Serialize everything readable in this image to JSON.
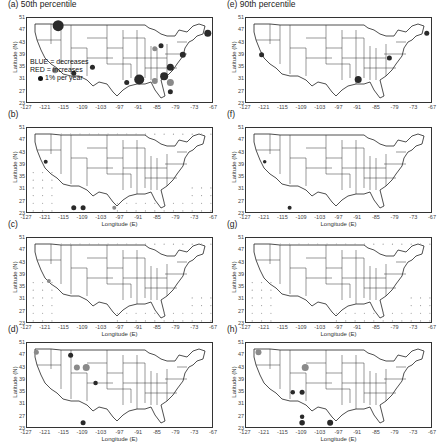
{
  "figure": {
    "panels": [
      {
        "id": "a",
        "title": "(a) 50th percentile",
        "left": 0,
        "top": 0,
        "show_xlabel": false,
        "show_legend": true
      },
      {
        "id": "b",
        "title": "(b)",
        "left": 0,
        "top": 110,
        "show_xlabel": true,
        "show_legend": false
      },
      {
        "id": "c",
        "title": "(c)",
        "left": 0,
        "top": 220,
        "show_xlabel": true,
        "show_legend": false
      },
      {
        "id": "d",
        "title": "(d)",
        "left": 0,
        "top": 325,
        "show_xlabel": true,
        "show_legend": false
      },
      {
        "id": "e",
        "title": "(e) 90th percentile",
        "left": 219,
        "top": 0,
        "show_xlabel": false,
        "show_legend": false
      },
      {
        "id": "f",
        "title": "(f)",
        "left": 219,
        "top": 110,
        "show_xlabel": true,
        "show_legend": false
      },
      {
        "id": "g",
        "title": "(g)",
        "left": 219,
        "top": 220,
        "show_xlabel": true,
        "show_legend": false
      },
      {
        "id": "h",
        "title": "(h)",
        "left": 219,
        "top": 325,
        "show_xlabel": true,
        "show_legend": false
      }
    ],
    "x_axis": {
      "label": "Longitude (E)",
      "ticks": [
        "-127",
        "-121",
        "-115",
        "-109",
        "-103",
        "-97",
        "-91",
        "-85",
        "-79",
        "-73",
        "-67"
      ],
      "range": [
        -127,
        -67
      ]
    },
    "y_axis": {
      "label": "Latitude (N)",
      "ticks": [
        "51",
        "47",
        "43",
        "39",
        "35",
        "31",
        "27",
        "23"
      ],
      "range": [
        23,
        51
      ]
    },
    "legend": {
      "line1": "BLUE = decreases",
      "line2": "RED = increases",
      "line3": "1% per year"
    },
    "colors": {
      "decrease": "#2a2a2a",
      "increase": "#8a8a8a",
      "outline": "#222222"
    }
  },
  "chart_data": [
    {
      "type": "scatter",
      "panel": "a",
      "title": "(a) 50th percentile",
      "xlabel": "Longitude (E)",
      "ylabel": "Latitude (N)",
      "xlim": [
        -127,
        -67
      ],
      "ylim": [
        23,
        51
      ],
      "points": [
        {
          "lon": -117,
          "lat": 48.5,
          "size": 10,
          "sign": "decrease"
        },
        {
          "lon": -69,
          "lat": 46,
          "size": 6,
          "sign": "decrease"
        },
        {
          "lon": -91,
          "lat": 31,
          "size": 9,
          "sign": "decrease"
        },
        {
          "lon": -83,
          "lat": 32,
          "size": 7,
          "sign": "decrease"
        },
        {
          "lon": -81,
          "lat": 30,
          "size": 6,
          "sign": "increase"
        },
        {
          "lon": -86,
          "lat": 30.5,
          "size": 5,
          "sign": "increase"
        },
        {
          "lon": -118,
          "lat": 34,
          "size": 5,
          "sign": "increase"
        },
        {
          "lon": -81,
          "lat": 35,
          "size": 6,
          "sign": "decrease"
        },
        {
          "lon": -77,
          "lat": 39,
          "size": 5,
          "sign": "decrease"
        },
        {
          "lon": -84,
          "lat": 42,
          "size": 4,
          "sign": "decrease"
        },
        {
          "lon": -95,
          "lat": 30,
          "size": 4,
          "sign": "decrease"
        },
        {
          "lon": -106,
          "lat": 35,
          "size": 4,
          "sign": "decrease"
        },
        {
          "lon": -112,
          "lat": 33,
          "size": 4,
          "sign": "decrease"
        },
        {
          "lon": -86,
          "lat": 41,
          "size": 4,
          "sign": "increase"
        },
        {
          "lon": -81,
          "lat": 27,
          "size": 4,
          "sign": "decrease"
        }
      ]
    },
    {
      "type": "scatter",
      "panel": "b",
      "title": "(b)",
      "grid_points": "sparse small dots; larger near SW (-110,25)",
      "points": [
        {
          "lon": -112,
          "lat": 25,
          "size": 4,
          "sign": "decrease"
        },
        {
          "lon": -109,
          "lat": 25,
          "size": 4,
          "sign": "decrease"
        },
        {
          "lon": -121,
          "lat": 40,
          "size": 3,
          "sign": "decrease"
        },
        {
          "lon": -99,
          "lat": 25,
          "size": 3,
          "sign": "increase"
        }
      ]
    },
    {
      "type": "scatter",
      "panel": "c",
      "title": "(c)",
      "grid_points": "small dots mostly SW offshore grid",
      "points": [
        {
          "lon": -120,
          "lat": 37,
          "size": 3,
          "sign": "increase"
        }
      ]
    },
    {
      "type": "scatter",
      "panel": "d",
      "title": "(d)",
      "points": [
        {
          "lon": -108,
          "lat": 43,
          "size": 6,
          "sign": "increase"
        },
        {
          "lon": -111,
          "lat": 43,
          "size": 5,
          "sign": "increase"
        },
        {
          "lon": -124,
          "lat": 48,
          "size": 4,
          "sign": "increase"
        },
        {
          "lon": -113,
          "lat": 47,
          "size": 4,
          "sign": "decrease"
        },
        {
          "lon": -105,
          "lat": 38,
          "size": 3.5,
          "sign": "decrease"
        },
        {
          "lon": -109,
          "lat": 25,
          "size": 4,
          "sign": "decrease"
        }
      ]
    },
    {
      "type": "scatter",
      "panel": "e",
      "title": "(e) 90th percentile",
      "points": [
        {
          "lon": -91,
          "lat": 31,
          "size": 6,
          "sign": "decrease"
        },
        {
          "lon": -122,
          "lat": 39,
          "size": 4,
          "sign": "decrease"
        },
        {
          "lon": -69,
          "lat": 46,
          "size": 4,
          "sign": "decrease"
        },
        {
          "lon": -81,
          "lat": 38,
          "size": 4,
          "sign": "decrease"
        }
      ]
    },
    {
      "type": "scatter",
      "panel": "f",
      "title": "(f)",
      "points": [
        {
          "lon": -113,
          "lat": 25,
          "size": 3,
          "sign": "decrease"
        },
        {
          "lon": -121,
          "lat": 40,
          "size": 2.5,
          "sign": "decrease"
        }
      ]
    },
    {
      "type": "scatter",
      "panel": "g",
      "title": "(g)",
      "grid_points": "tiny dots SW offshore grid",
      "points": []
    },
    {
      "type": "scatter",
      "panel": "h",
      "title": "(h)",
      "points": [
        {
          "lon": -108,
          "lat": 43,
          "size": 6,
          "sign": "increase"
        },
        {
          "lon": -123,
          "lat": 48,
          "size": 5,
          "sign": "increase"
        },
        {
          "lon": -109,
          "lat": 25,
          "size": 4.5,
          "sign": "decrease"
        },
        {
          "lon": -100,
          "lat": 25,
          "size": 5,
          "sign": "decrease"
        },
        {
          "lon": -109,
          "lat": 35,
          "size": 4,
          "sign": "decrease"
        },
        {
          "lon": -112,
          "lat": 35,
          "size": 3.5,
          "sign": "decrease"
        },
        {
          "lon": -109,
          "lat": 27,
          "size": 3.5,
          "sign": "decrease"
        }
      ]
    }
  ]
}
